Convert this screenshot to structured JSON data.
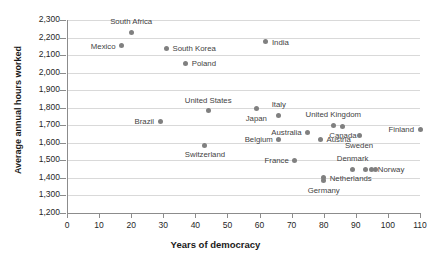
{
  "chart_data": {
    "type": "scatter",
    "title": "",
    "xlabel": "Years of democracy",
    "ylabel": "Average annual hours worked",
    "xlim": [
      0,
      110
    ],
    "ylim": [
      1200,
      2300
    ],
    "xticks": [
      0,
      10,
      20,
      30,
      40,
      50,
      60,
      70,
      80,
      90,
      100,
      110
    ],
    "yticks": [
      "1,200",
      "1,300",
      "1,400",
      "1,500",
      "1,600",
      "1,700",
      "1,800",
      "1,900",
      "2,000",
      "2,100",
      "2,200",
      "2,300"
    ],
    "grid": true,
    "legend": "none",
    "marker_color": "#808080",
    "points": [
      {
        "label": "South Africa",
        "x": 20,
        "y": 2230,
        "pos": "above"
      },
      {
        "label": "Mexico",
        "x": 17,
        "y": 2152,
        "pos": "left"
      },
      {
        "label": "South Korea",
        "x": 31,
        "y": 2140,
        "pos": "right"
      },
      {
        "label": "Poland",
        "x": 37,
        "y": 2053,
        "pos": "right"
      },
      {
        "label": "India",
        "x": 62,
        "y": 2175,
        "pos": "right"
      },
      {
        "label": "United States",
        "x": 44,
        "y": 1783,
        "pos": "above"
      },
      {
        "label": "Brazil",
        "x": 29,
        "y": 1723,
        "pos": "left"
      },
      {
        "label": "Japan",
        "x": 59,
        "y": 1793,
        "pos": "below"
      },
      {
        "label": "Italy",
        "x": 66,
        "y": 1757,
        "pos": "above"
      },
      {
        "label": "United Kingdom",
        "x": 83,
        "y": 1700,
        "pos": "above"
      },
      {
        "label": "Canada",
        "x": 86,
        "y": 1695,
        "pos": "below"
      },
      {
        "label": "Finland",
        "x": 110,
        "y": 1678,
        "pos": "left"
      },
      {
        "label": "Australia",
        "x": 75,
        "y": 1660,
        "pos": "left"
      },
      {
        "label": "Sweden",
        "x": 91,
        "y": 1640,
        "pos": "below"
      },
      {
        "label": "Belgium",
        "x": 66,
        "y": 1620,
        "pos": "left"
      },
      {
        "label": "Austria",
        "x": 79,
        "y": 1620,
        "pos": "right"
      },
      {
        "label": "Switzerland",
        "x": 43,
        "y": 1585,
        "pos": "below"
      },
      {
        "label": "France",
        "x": 71,
        "y": 1500,
        "pos": "left"
      },
      {
        "label": "Denmark",
        "x": 89,
        "y": 1450,
        "pos": "above"
      },
      {
        "label": "Norway",
        "x": 95,
        "y": 1448,
        "pos": "right"
      },
      {
        "label": "Netherlands",
        "x": 80,
        "y": 1400,
        "pos": "right"
      },
      {
        "label": "Germany",
        "x": 80,
        "y": 1383,
        "pos": "below"
      }
    ],
    "extra_markers": [
      {
        "x": 93,
        "y": 1448
      },
      {
        "x": 96,
        "y": 1448
      }
    ]
  }
}
